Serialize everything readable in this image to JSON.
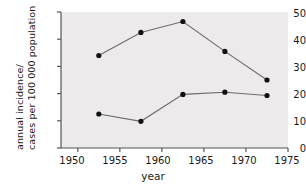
{
  "chart_data": {
    "type": "line",
    "title": "",
    "subtitle": "",
    "xlabel": "year",
    "ylabel_line1": "annual incidence/",
    "ylabel_line2": "cases per 100 000 population",
    "xlim": [
      1948,
      1975
    ],
    "ylim": [
      0,
      50
    ],
    "xticks": [
      1950,
      1955,
      1960,
      1965,
      1970,
      1975
    ],
    "xtick_labels": [
      "1950",
      "1955",
      "1960",
      "1965",
      "1970",
      "1975"
    ],
    "yticks": [
      0,
      10,
      20,
      30,
      40,
      50
    ],
    "ytick_labels": [
      "0",
      "10",
      "20",
      "30",
      "40",
      "50"
    ],
    "grid": false,
    "legend_position": "inline-right",
    "x": [
      1952.5,
      1957.5,
      1962.5,
      1967.5,
      1972.5
    ],
    "series": [
      {
        "name": "females",
        "label": "females",
        "color": "#111111",
        "line_color": "#6b6b6b",
        "marker": "filled-circle",
        "values": [
          34.0,
          42.5,
          46.5,
          35.5,
          25.0
        ]
      },
      {
        "name": "males",
        "label": "males",
        "color": "#111111",
        "line_color": "#6b6b6b",
        "marker": "filled-circle",
        "values": [
          12.5,
          9.8,
          19.7,
          20.5,
          19.3
        ]
      }
    ],
    "plot_background": "#eceaea",
    "axis_color": "#555555"
  }
}
